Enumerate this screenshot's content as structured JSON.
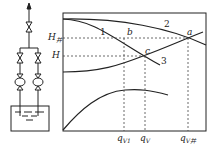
{
  "schematic": {
    "description": "Two pumps in parallel drawing from a tank",
    "pump_count": 2
  },
  "graph": {
    "y_labels": [
      {
        "main": "H",
        "sub": "并",
        "id": "H-parallel"
      },
      {
        "main": "H",
        "sub": "",
        "id": "H"
      }
    ],
    "x_labels": [
      {
        "main": "q",
        "sub": "V1",
        "id": "qV1"
      },
      {
        "main": "q",
        "sub": "V",
        "id": "qV"
      },
      {
        "main": "q",
        "sub": "V并",
        "id": "qV-parallel"
      }
    ],
    "curve_labels": [
      "1",
      "2",
      "3"
    ],
    "point_labels": [
      "a",
      "b",
      "c"
    ]
  }
}
